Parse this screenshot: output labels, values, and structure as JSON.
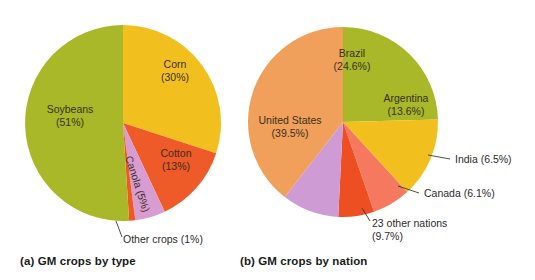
{
  "figure": {
    "background": "#ffffff",
    "text_color": "#2b2b2b"
  },
  "captions": {
    "a": "(a) GM crops by type",
    "b": "(b) GM crops by nation"
  },
  "chart_data": [
    {
      "type": "pie",
      "id": "gm-crops-by-type",
      "title": "(a) GM crops by type",
      "center": [
        123,
        123
      ],
      "radius": 98,
      "start_angle_deg": 0,
      "direction": "clockwise",
      "categories": [
        "Corn",
        "Cotton",
        "Canola",
        "Other crops",
        "Soybeans"
      ],
      "values": [
        30,
        13,
        5,
        1,
        51
      ],
      "unit": "%",
      "colors": [
        "#F2C01E",
        "#EE5A28",
        "#D89CD0",
        "#F05A22",
        "#A8B828"
      ],
      "labels": [
        {
          "name": "Corn",
          "line1": "Corn",
          "line2": "(30%)",
          "placement": "inside",
          "x": 175,
          "y": 68,
          "rotation": 0,
          "anchor": "middle"
        },
        {
          "name": "Cotton",
          "line1": "Cotton",
          "line2": "(13%)",
          "placement": "inside",
          "x": 176,
          "y": 157,
          "rotation": 0,
          "anchor": "middle"
        },
        {
          "name": "Canola",
          "line1": "Canola (5%)",
          "line2": "",
          "placement": "inside-rotated",
          "x": 134,
          "y": 185,
          "rotation": 72,
          "anchor": "middle"
        },
        {
          "name": "Other crops",
          "line1": "Other crops (1%)",
          "line2": "",
          "placement": "outside",
          "x": 123,
          "y": 243,
          "anchor": "start",
          "leader": [
            [
              116,
              221
            ],
            [
              122,
              237
            ]
          ]
        },
        {
          "name": "Soybeans",
          "line1": "Soybeans",
          "line2": "(51%)",
          "placement": "inside",
          "x": 70,
          "y": 113,
          "rotation": 0,
          "anchor": "middle"
        }
      ],
      "legend": "none",
      "grid": false
    },
    {
      "type": "pie",
      "id": "gm-crops-by-nation",
      "title": "(b) GM crops by nation",
      "center": [
        343,
        122
      ],
      "radius": 95,
      "start_angle_deg": 0,
      "direction": "clockwise",
      "categories": [
        "Brazil",
        "Argentina",
        "India",
        "Canada",
        "23 other nations",
        "United States"
      ],
      "values": [
        24.6,
        13.6,
        6.5,
        6.1,
        9.7,
        39.5
      ],
      "unit": "%",
      "colors": [
        "#A8B828",
        "#F2C01E",
        "#F4795E",
        "#EE4F22",
        "#CE9BD4",
        "#F0A05A"
      ],
      "labels": [
        {
          "name": "Brazil",
          "line1": "Brazil",
          "line2": "(24.6%)",
          "placement": "inside",
          "x": 352,
          "y": 57,
          "anchor": "middle"
        },
        {
          "name": "Argentina",
          "line1": "Argentina",
          "line2": "(13.6%)",
          "placement": "inside",
          "x": 406,
          "y": 102,
          "anchor": "middle"
        },
        {
          "name": "India",
          "line1": "India (6.5%)",
          "line2": "",
          "placement": "outside",
          "x": 455,
          "y": 163,
          "anchor": "start",
          "leader": [
            [
              428,
              155
            ],
            [
              450,
              159
            ]
          ]
        },
        {
          "name": "Canada",
          "line1": "Canada (6.1%)",
          "line2": "",
          "placement": "outside",
          "x": 424,
          "y": 197,
          "anchor": "start",
          "leader": [
            [
              398,
              186
            ],
            [
              419,
              193
            ]
          ]
        },
        {
          "name": "23 other nations",
          "line1": "23 other nations",
          "line2": "(9.7%)",
          "placement": "outside",
          "x": 372,
          "y": 227,
          "anchor": "start",
          "leader": [
            [
              362,
              208
            ],
            [
              370,
              221
            ]
          ]
        },
        {
          "name": "United States",
          "line1": "United States",
          "line2": "(39.5%)",
          "placement": "inside",
          "x": 290,
          "y": 124,
          "anchor": "middle"
        }
      ],
      "legend": "none",
      "grid": false
    }
  ]
}
